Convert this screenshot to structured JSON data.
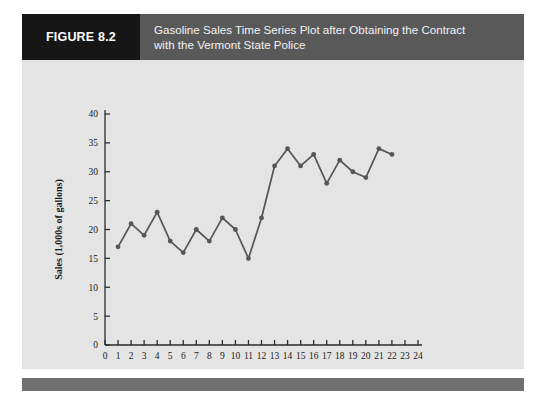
{
  "figure": {
    "number_label": "FIGURE 8.2",
    "caption_line1": "Gasoline Sales Time Series Plot after Obtaining the Contract",
    "caption_line2": "with the Vermont State Police",
    "caption_full": "Gasoline Sales Time Series Plot after Obtaining the Contract with the Vermont State Police"
  },
  "colors": {
    "header_bar": "#595959",
    "number_block": "#161616",
    "card_background": "#e4e4e4",
    "footer_bar": "#6f6f6f",
    "series_line": "#555555",
    "axis": "#2b2b2b"
  },
  "chart_data": {
    "type": "line",
    "title": "Gasoline Sales Time Series Plot after Obtaining the Contract with the Vermont State Police",
    "xlabel": "Week",
    "ylabel": "Sales (1,000s of gallons)",
    "x": [
      1,
      2,
      3,
      4,
      5,
      6,
      7,
      8,
      9,
      10,
      11,
      12,
      13,
      14,
      15,
      16,
      17,
      18,
      19,
      20,
      21,
      22
    ],
    "values": [
      17,
      21,
      19,
      23,
      18,
      16,
      20,
      18,
      22,
      20,
      15,
      22,
      31,
      34,
      31,
      33,
      28,
      32,
      30,
      29,
      34,
      33
    ],
    "series": [
      {
        "name": "Gasoline Sales",
        "values": [
          17,
          21,
          19,
          23,
          18,
          16,
          20,
          18,
          22,
          20,
          15,
          22,
          31,
          34,
          31,
          33,
          28,
          32,
          30,
          29,
          34,
          33
        ]
      }
    ],
    "xlim": [
      0,
      24
    ],
    "ylim": [
      0,
      40
    ],
    "xticks": [
      0,
      1,
      2,
      3,
      4,
      5,
      6,
      7,
      8,
      9,
      10,
      11,
      12,
      13,
      14,
      15,
      16,
      17,
      18,
      19,
      20,
      21,
      22,
      23,
      24
    ],
    "xtick_labels": [
      "0",
      "1",
      "2",
      "3",
      "4",
      "5",
      "6",
      "7",
      "8",
      "9",
      "10",
      "11",
      "12",
      "13",
      "14",
      "15",
      "16",
      "17",
      "18",
      "19",
      "20",
      "21",
      "22",
      "23",
      "24"
    ],
    "yticks": [
      0,
      5,
      10,
      15,
      20,
      25,
      30,
      35,
      40
    ],
    "ytick_labels": [
      "0",
      "5",
      "10",
      "15",
      "20",
      "25",
      "30",
      "35",
      "40"
    ],
    "grid": false,
    "legend": null,
    "markers": true
  }
}
